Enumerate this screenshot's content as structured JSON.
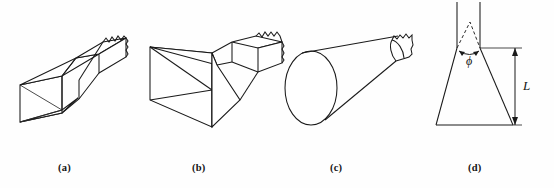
{
  "figure": {
    "title": "",
    "background_color": "#fefefe",
    "line_color": "#1a1a1a",
    "panels": [
      {
        "id": "a",
        "caption": "(a)",
        "name": "sectoral-horn-antenna",
        "description": "E-plane sectoral horn antenna flaring from rectangular waveguide"
      },
      {
        "id": "b",
        "caption": "(b)",
        "name": "pyramidal-horn-antenna",
        "description": "Pyramidal horn antenna with large rectangular aperture"
      },
      {
        "id": "c",
        "caption": "(c)",
        "name": "conical-horn-antenna",
        "description": "Conical horn antenna with circular aperture"
      },
      {
        "id": "d",
        "caption": "(d)",
        "name": "horn-cross-section",
        "description": "Cross-sectional view of horn showing flare angle and axial length"
      }
    ],
    "annotations": {
      "flare_angle_symbol": "ϕ",
      "axial_length_symbol": "L"
    }
  }
}
